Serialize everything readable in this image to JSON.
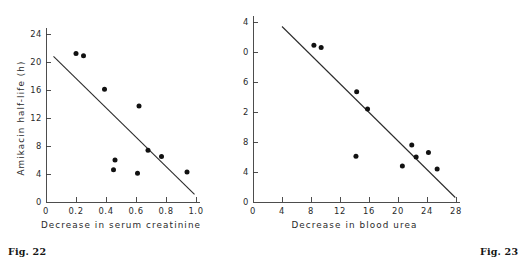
{
  "figures": [
    {
      "caption": "Fig. 22",
      "ylabel": "Amikacin half-life (h)",
      "xlabel": "Decrease in serum creatinine",
      "yticks": [
        "0",
        "4",
        "8",
        "12",
        "16",
        "20",
        "24"
      ],
      "xticks": [
        "0",
        "0.2",
        "0.4",
        "0.6",
        "0.8",
        "1.0"
      ]
    },
    {
      "caption": "Fig. 23",
      "ylabel": "Amikacin half-life (h)",
      "xlabel": "Decrease in blood urea",
      "yticks": [
        "0",
        "4",
        "8",
        "12",
        "16",
        "20",
        "24"
      ],
      "xticks": [
        "0",
        "4",
        "8",
        "12",
        "16",
        "20",
        "24",
        "28"
      ]
    }
  ],
  "chart_data": [
    {
      "type": "scatter",
      "title": "Fig. 22",
      "xlabel": "Decrease in serum creatinine",
      "ylabel": "Amikacin half-life (h)",
      "xlim": [
        0,
        1.0
      ],
      "ylim": [
        0,
        24
      ],
      "xticks": [
        0,
        0.2,
        0.4,
        0.6,
        0.8,
        1.0
      ],
      "yticks": [
        0,
        4,
        8,
        12,
        16,
        20,
        24
      ],
      "grid": false,
      "legend": "none",
      "points": [
        {
          "x": 0.2,
          "y": 21.2
        },
        {
          "x": 0.25,
          "y": 20.9
        },
        {
          "x": 0.39,
          "y": 16.1
        },
        {
          "x": 0.62,
          "y": 13.7
        },
        {
          "x": 0.68,
          "y": 7.4
        },
        {
          "x": 0.77,
          "y": 6.5
        },
        {
          "x": 0.46,
          "y": 6.0
        },
        {
          "x": 0.45,
          "y": 4.6
        },
        {
          "x": 0.61,
          "y": 4.1
        },
        {
          "x": 0.94,
          "y": 4.3
        }
      ],
      "fit_line": {
        "x0": 0.05,
        "y0": 20.8,
        "x1": 0.99,
        "y1": 1.1
      }
    },
    {
      "type": "scatter",
      "title": "Fig. 23",
      "xlabel": "Decrease in blood urea",
      "ylabel": "Amikacin half-life (h)",
      "xlim": [
        0,
        28
      ],
      "ylim": [
        0,
        24
      ],
      "xticks": [
        0,
        4,
        8,
        12,
        16,
        20,
        24,
        28
      ],
      "yticks": [
        0,
        4,
        8,
        12,
        16,
        20,
        24
      ],
      "grid": false,
      "legend": "none",
      "points": [
        {
          "x": 8.4,
          "y": 20.9
        },
        {
          "x": 9.4,
          "y": 20.6
        },
        {
          "x": 14.3,
          "y": 14.7
        },
        {
          "x": 15.8,
          "y": 12.4
        },
        {
          "x": 21.9,
          "y": 7.6
        },
        {
          "x": 22.5,
          "y": 6.0
        },
        {
          "x": 24.2,
          "y": 6.6
        },
        {
          "x": 14.2,
          "y": 6.1
        },
        {
          "x": 20.6,
          "y": 4.8
        },
        {
          "x": 25.4,
          "y": 4.4
        }
      ],
      "fit_line": {
        "x0": 4.0,
        "y0": 23.4,
        "x1": 27.9,
        "y1": 0.6
      }
    }
  ]
}
